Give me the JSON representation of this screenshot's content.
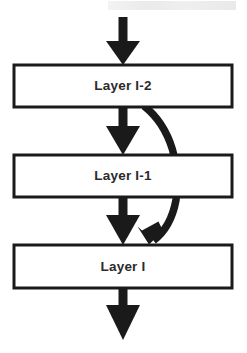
{
  "diagram": {
    "type": "flowchart",
    "colors": {
      "background": "#ffffff",
      "box_stroke": "#1a1a1a",
      "box_fill": "#ffffff",
      "arrow": "#1a1a1a",
      "text": "#2b2b2b"
    },
    "boxes": [
      {
        "id": "layer-l-2",
        "label": "Layer I-2",
        "x": 14,
        "y": 65,
        "width": 218,
        "height": 42
      },
      {
        "id": "layer-l-1",
        "label": "Layer I-1",
        "x": 14,
        "y": 155,
        "width": 218,
        "height": 42
      },
      {
        "id": "layer-l",
        "label": "Layer I",
        "x": 14,
        "y": 245,
        "width": 218,
        "height": 43
      }
    ],
    "arrows": [
      {
        "id": "input-arrow",
        "kind": "straight",
        "from": "input",
        "to": "layer-l-2"
      },
      {
        "id": "l2-to-l1-arrow",
        "kind": "straight",
        "from": "layer-l-2",
        "to": "layer-l-1"
      },
      {
        "id": "l1-to-l-arrow",
        "kind": "straight",
        "from": "layer-l-1",
        "to": "layer-l"
      },
      {
        "id": "output-arrow",
        "kind": "straight",
        "from": "layer-l",
        "to": "output"
      },
      {
        "id": "skip-connection-arrow",
        "kind": "curved",
        "from": "layer-l-2",
        "to": "layer-l"
      }
    ]
  }
}
